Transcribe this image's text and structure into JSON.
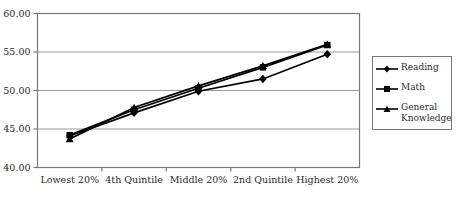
{
  "chart_data": {
    "type": "line",
    "title": "",
    "subtitle": "",
    "xlabel": "",
    "ylabel": "",
    "categories": [
      "Lowest 20%",
      "4th Quintile",
      "Middle 20%",
      "2nd Quintile",
      "Highest 20%"
    ],
    "series": [
      {
        "name": "Reading",
        "marker": "diamond",
        "color": "#000000",
        "values": [
          44.1,
          47.1,
          49.9,
          51.5,
          54.7
        ]
      },
      {
        "name": "Math",
        "marker": "square",
        "color": "#000000",
        "values": [
          44.2,
          47.5,
          50.3,
          53.0,
          55.9
        ]
      },
      {
        "name": "General Knowledge",
        "marker": "triangle",
        "color": "#000000",
        "values": [
          43.7,
          47.8,
          50.6,
          53.2,
          56.0
        ]
      }
    ],
    "ylim": [
      40.0,
      60.0
    ],
    "ytick_values": [
      40.0,
      45.0,
      50.0,
      55.0,
      60.0
    ],
    "ytick_labels": [
      "40.00",
      "45.00",
      "50.00",
      "55.00",
      "60.00"
    ],
    "grid": "horizontal",
    "legend_position": "right",
    "plot_border_color": "#7a7a7a",
    "gridline_color": "#9a9a9a"
  },
  "legend": {
    "entries": [
      {
        "label": "Reading",
        "marker": "diamond"
      },
      {
        "label": "Math",
        "marker": "square"
      },
      {
        "label": "General Knowledge",
        "marker": "triangle"
      }
    ]
  }
}
